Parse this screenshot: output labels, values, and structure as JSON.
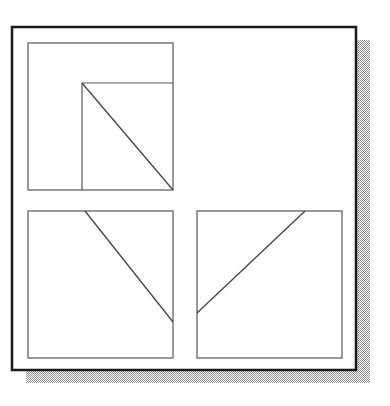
{
  "figure": {
    "canvas": {
      "width": 390,
      "height": 406
    },
    "colors": {
      "background": "#ffffff",
      "card_fill": "#ffffff",
      "card_border": "#1a1a1a",
      "panel_border": "#555555",
      "line_stroke": "#444444",
      "shadow": "#9a9a9a"
    },
    "card": {
      "name": "outer-card",
      "x": 12,
      "y": 27,
      "width": 344,
      "height": 343,
      "border_width": 2.5
    },
    "shadow": {
      "name": "card-drop-shadow",
      "offset_x": 14,
      "offset_y": 13,
      "fill": "#9a9a9a"
    },
    "panels": [
      {
        "id": "panel-top-left",
        "label": "Top-left panel",
        "x": 28,
        "y": 43,
        "width": 145,
        "height": 147,
        "border_width": 1.2,
        "inner_square": {
          "name": "inner-nested-square",
          "x": 82,
          "y": 83,
          "width": 91,
          "height": 107
        },
        "diagonal": {
          "name": "diagonal-line",
          "direction": "top-left-to-bottom-right",
          "x1": 82,
          "y1": 83,
          "x2": 173,
          "y2": 190
        }
      },
      {
        "id": "panel-bottom-left",
        "label": "Bottom-left panel",
        "x": 28,
        "y": 211,
        "width": 145,
        "height": 147,
        "border_width": 1.2,
        "inner_square": null,
        "diagonal": {
          "name": "diagonal-line",
          "direction": "top-middle-to-right-edge",
          "x1": 85,
          "y1": 211,
          "x2": 173,
          "y2": 322
        }
      },
      {
        "id": "panel-bottom-right",
        "label": "Bottom-right panel",
        "x": 197,
        "y": 211,
        "width": 145,
        "height": 147,
        "border_width": 1.2,
        "inner_square": null,
        "diagonal": {
          "name": "diagonal-line",
          "direction": "left-edge-to-top-middle",
          "x1": 197,
          "y1": 313,
          "x2": 305,
          "y2": 211
        }
      }
    ]
  }
}
